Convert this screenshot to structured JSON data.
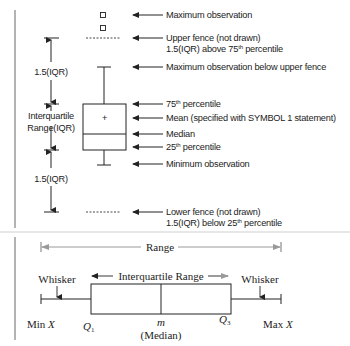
{
  "top_diagram": {
    "annotations": [
      {
        "id": "max-obs",
        "text": "Maximum observation"
      },
      {
        "id": "upper-fence",
        "line1": "Upper fence (not drawn)",
        "line2_pre": "1.5(IQR) above 75",
        "line2_sup": "th",
        "line2_post": " percentile"
      },
      {
        "id": "max-below-fence",
        "text": "Maximum observation below upper fence"
      },
      {
        "id": "p75",
        "pre": "75",
        "sup": "th",
        "post": " percentile"
      },
      {
        "id": "mean",
        "text": "Mean (specified with SYMBOL 1 statement)"
      },
      {
        "id": "median",
        "text": "Median"
      },
      {
        "id": "p25",
        "pre": "25",
        "sup": "th",
        "post": " percentile"
      },
      {
        "id": "min-obs",
        "text": "Minimum observation"
      },
      {
        "id": "lower-fence",
        "line1": "Lower fence (not drawn)",
        "line2_pre": "1.5(IQR) below 25",
        "line2_sup": "th",
        "line2_post": " percentile"
      }
    ],
    "dimension_labels": {
      "upper_span": "1.5(IQR)",
      "iqr_line1": "Interquartile",
      "iqr_line2": "Range(IQR)",
      "lower_span": "1.5(IQR)"
    },
    "mean_symbol": "+"
  },
  "bottom_diagram": {
    "range_label": "Range",
    "iqr_label": "Interquartile Range",
    "whisker_left": "Whisker",
    "whisker_right": "Whisker",
    "min_label": "Min",
    "max_label": "Max",
    "x_var": "X",
    "q1": "Q",
    "q1_sub": "1",
    "q3": "Q",
    "q3_sub": "3",
    "median_symbol": "m",
    "median_label": "(Median)"
  },
  "colors": {
    "line": "#222222",
    "range_arrow": "#9a9a9a",
    "left_bar": "#8a8a8a",
    "divider": "#cfcfcf"
  }
}
